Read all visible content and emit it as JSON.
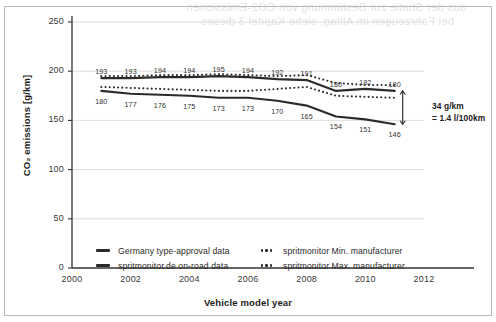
{
  "bleed_text": {
    "line1": "aus der Studie zur Bestimmung von CO2-Emissionen",
    "line2": "bei Fahrzeugen im Alltag, siehe Kapitel 3 dieses"
  },
  "chart_data": {
    "type": "line",
    "title": "",
    "xlabel": "Vehicle model year",
    "ylabel": "CO₂ emissions [g/km]",
    "xlim": [
      2000,
      2012
    ],
    "ylim": [
      0,
      250
    ],
    "xticks": [
      2000,
      2002,
      2004,
      2006,
      2008,
      2010,
      2012
    ],
    "yticks": [
      0,
      50,
      100,
      150,
      200,
      250
    ],
    "grid": "horizontal",
    "legend_position": "bottom",
    "x": [
      2001,
      2002,
      2003,
      2004,
      2005,
      2006,
      2007,
      2008,
      2009,
      2010,
      2011
    ],
    "series": [
      {
        "name": "Germany type-approval data",
        "style": "solid",
        "color": "#2b2b2b",
        "values": [
          193,
          193,
          194,
          194,
          195,
          194,
          192,
          191,
          180,
          182,
          180
        ],
        "labels": [
          "193",
          "193",
          "194",
          "194",
          "195",
          "194",
          "192",
          "191",
          "180",
          "182",
          "180"
        ],
        "label_side": "above"
      },
      {
        "name": "spritmonitor.de on-road data",
        "style": "solid",
        "color": "#2b2b2b",
        "values": [
          180,
          177,
          176,
          175,
          173,
          173,
          170,
          165,
          154,
          151,
          146
        ],
        "labels": [
          "180",
          "177",
          "176",
          "175",
          "173",
          "173",
          "170",
          "165",
          "154",
          "151",
          "146"
        ],
        "label_side": "below"
      },
      {
        "name": "spritmonitor Max. manufacturer",
        "style": "dotted",
        "color": "#2b2b2b",
        "values": [
          195,
          195,
          196,
          196,
          197,
          196,
          195,
          196,
          188,
          186,
          186
        ]
      },
      {
        "name": "spritmonitor Min. manufacturer",
        "style": "dotted",
        "color": "#2b2b2b",
        "values": [
          184,
          183,
          182,
          181,
          180,
          180,
          182,
          184,
          175,
          174,
          173
        ]
      }
    ],
    "annotation": {
      "line1": "34 g/km",
      "line2": "= 1.4 l/100km",
      "arrow": "double-headed-vertical",
      "at_year": 2011,
      "from_value": 180,
      "to_value": 146
    }
  },
  "legend": {
    "items": [
      {
        "key": "solid",
        "label": "Germany type-approval data"
      },
      {
        "key": "dotted",
        "label": "spritmonitor Min. manufacturer"
      },
      {
        "key": "solid",
        "label": "spritmonitor.de on-road data"
      },
      {
        "key": "dotted",
        "label": "spritmonitor Max. manufacturer"
      }
    ]
  }
}
